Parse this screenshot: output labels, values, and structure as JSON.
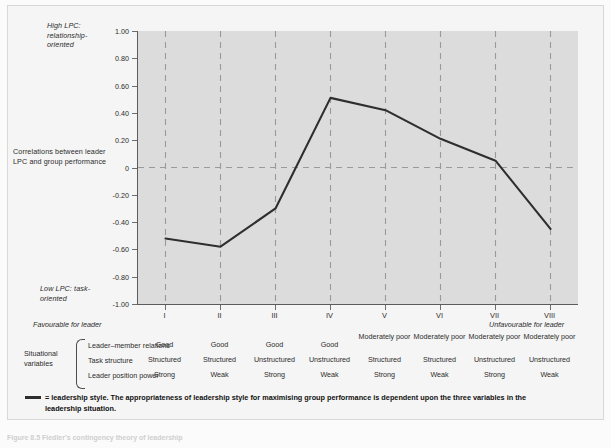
{
  "figure": {
    "y_axis_notes": {
      "high": "High LPC:\nrelationship-\noriented",
      "middle": "Correlations\nbetween leader\nLPC and group\nperformance",
      "low": "Low LPC:\ntask-oriented"
    },
    "favourable_left": "Favourable for leader",
    "favourable_right": "Unfavourable for leader",
    "situational_label": "Situational\nvariables",
    "row_names": [
      "Leader–member relations",
      "Task structure",
      "Leader position power"
    ],
    "legend_line1": "= leadership style.   The appropriateness of leadership style for maximising group performance is dependent upon the three variables in the",
    "legend_line2": "leadership situation.",
    "caption": "Figure 8.5  Fiedler's contingency theory of leadership",
    "colors": {
      "plot_background": "#dcdcdc",
      "panel_background": "#f5f5f5",
      "line": "#2e2e2e",
      "gridline": "#9a9a9a",
      "axis": "#5c5c5c"
    }
  },
  "chart_data": {
    "type": "line",
    "title": "",
    "xlabel": "",
    "ylabel": "Correlations between leader LPC and group performance",
    "categories": [
      "I",
      "II",
      "III",
      "IV",
      "V",
      "VI",
      "VII",
      "VIII"
    ],
    "values": [
      -0.52,
      -0.58,
      -0.3,
      0.51,
      0.42,
      0.21,
      0.05,
      -0.45
    ],
    "series": [
      {
        "name": "leadership style",
        "values": [
          -0.52,
          -0.58,
          -0.3,
          0.51,
          0.42,
          0.21,
          0.05,
          -0.45
        ]
      }
    ],
    "ylim": [
      -1.0,
      1.0
    ],
    "yticks": [
      "1.00",
      "0.80",
      "0.60",
      "0.40",
      "0.20",
      "0",
      "-0.20",
      "-0.40",
      "-0.60",
      "-0.80",
      "-1.00"
    ],
    "ytick_values": [
      1.0,
      0.8,
      0.6,
      0.4,
      0.2,
      0,
      -0.2,
      -0.4,
      -0.6,
      -0.8,
      -1.0
    ],
    "grid": true,
    "grid_style": "dashed",
    "legend_position": "below",
    "table": {
      "row_headers": [
        "Leader–member relations",
        "Task structure",
        "Leader position power"
      ],
      "columns": [
        "I",
        "II",
        "III",
        "IV",
        "V",
        "VI",
        "VII",
        "VIII"
      ],
      "rows": [
        [
          "Good",
          "Good",
          "Good",
          "Good",
          "Moderately poor",
          "Moderately poor",
          "Moderately poor",
          "Moderately poor"
        ],
        [
          "Structured",
          "Structured",
          "Unstructured",
          "Unstructured",
          "Structured",
          "Structured",
          "Unstructured",
          "Unstructured"
        ],
        [
          "Strong",
          "Weak",
          "Strong",
          "Weak",
          "Strong",
          "Weak",
          "Strong",
          "Weak"
        ]
      ]
    }
  }
}
